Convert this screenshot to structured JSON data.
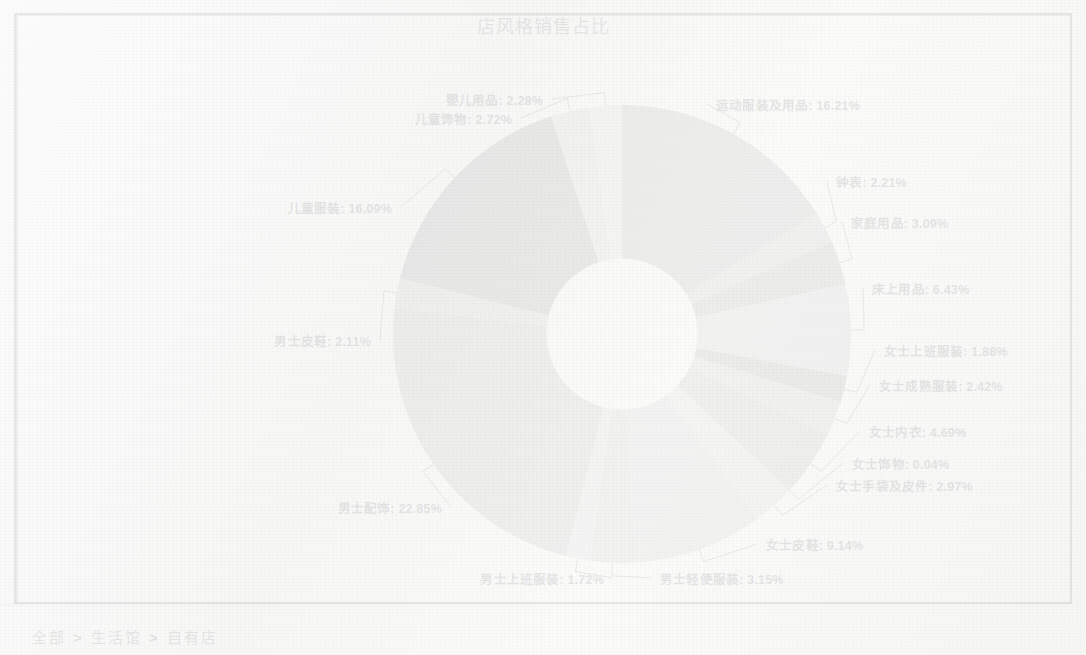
{
  "page": {
    "title": "店风格销售占比"
  },
  "breadcrumb": {
    "separator": ">",
    "items": [
      {
        "label": "全部"
      },
      {
        "label": "生活馆"
      },
      {
        "label": "自有店"
      }
    ]
  },
  "chart_data": {
    "type": "pie",
    "variant": "donut",
    "title": "店风格销售占比",
    "xlabel": "",
    "ylabel": "",
    "legend_position": "none",
    "label_format": "{name}: {percent}%",
    "start_angle_deg": -90,
    "direction": "clockwise",
    "inner_radius_ratio": 0.33,
    "categories": [
      "运动服装及用品",
      "钟表",
      "家庭用品",
      "床上用品",
      "女士上班服装",
      "女士成熟服装",
      "女士内衣",
      "女士饰物",
      "女士手袋及皮件",
      "女士皮鞋",
      "男士轻便服装",
      "男士上班服装",
      "男士配饰",
      "男士皮鞋",
      "儿童服装",
      "儿童饰物",
      "婴儿用品"
    ],
    "values": [
      16.21,
      2.21,
      3.09,
      6.43,
      1.88,
      2.42,
      4.69,
      0.04,
      2.97,
      9.14,
      3.15,
      1.72,
      22.85,
      2.11,
      16.09,
      2.72,
      2.28
    ],
    "unit": "%",
    "colors": [
      "#7d7d7d",
      "#9a9a9a",
      "#6e6e6e",
      "#a8a8a8",
      "#636363",
      "#9f9f9f",
      "#8c8c8c",
      "#5e5e5e",
      "#c2c2c2",
      "#b0b0b0",
      "#a3a3a3",
      "#bdbdbd",
      "#8a8a8a",
      "#9d9d9d",
      "#5a5a5a",
      "#b5b5b5",
      "#cbcbcb"
    ],
    "slices": [
      {
        "name": "运动服装及用品",
        "percent": 16.21,
        "label": "运动服装及用品: 16.21%"
      },
      {
        "name": "钟表",
        "percent": 2.21,
        "label": "钟表: 2.21%"
      },
      {
        "name": "家庭用品",
        "percent": 3.09,
        "label": "家庭用品: 3.09%"
      },
      {
        "name": "床上用品",
        "percent": 6.43,
        "label": "床上用品: 6.43%"
      },
      {
        "name": "女士上班服装",
        "percent": 1.88,
        "label": "女士上班服装: 1.88%"
      },
      {
        "name": "女士成熟服装",
        "percent": 2.42,
        "label": "女士成熟服装: 2.42%"
      },
      {
        "name": "女士内衣",
        "percent": 4.69,
        "label": "女士内衣: 4.69%"
      },
      {
        "name": "女士饰物",
        "percent": 0.04,
        "label": "女士饰物: 0.04%"
      },
      {
        "name": "女士手袋及皮件",
        "percent": 2.97,
        "label": "女士手袋及皮件: 2.97%"
      },
      {
        "name": "女士皮鞋",
        "percent": 9.14,
        "label": "女士皮鞋: 9.14%"
      },
      {
        "name": "男士轻便服装",
        "percent": 3.15,
        "label": "男士轻便服装: 3.15%"
      },
      {
        "name": "男士上班服装",
        "percent": 1.72,
        "label": "男士上班服装: 1.72%"
      },
      {
        "name": "男士配饰",
        "percent": 22.85,
        "label": "男士配饰: 22.85%"
      },
      {
        "name": "男士皮鞋",
        "percent": 2.11,
        "label": "男士皮鞋: 2.11%"
      },
      {
        "name": "儿童服装",
        "percent": 16.09,
        "label": "儿童服装: 16.09%"
      },
      {
        "name": "儿童饰物",
        "percent": 2.72,
        "label": "儿童饰物: 2.72%"
      },
      {
        "name": "婴儿用品",
        "percent": 2.28,
        "label": "婴儿用品: 2.28%"
      }
    ]
  }
}
